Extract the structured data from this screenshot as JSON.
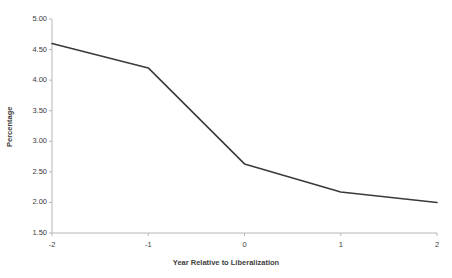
{
  "chart_data": {
    "type": "line",
    "title": "",
    "subtitle": "",
    "xlabel": "Year Relative to Liberalization",
    "ylabel": "Percentage",
    "x": [
      -2,
      -1,
      0,
      1,
      2
    ],
    "xtick_labels": [
      "-2",
      "-1",
      "0",
      "1",
      "2"
    ],
    "values": [
      4.6,
      4.2,
      2.63,
      2.17,
      2.0
    ],
    "ytick_labels": [
      "5.00",
      "4.50",
      "4.00",
      "3.50",
      "3.00",
      "2.50",
      "2.00",
      "1.50"
    ],
    "ytick_values": [
      5.0,
      4.5,
      4.0,
      3.5,
      3.0,
      2.5,
      2.0,
      1.5
    ],
    "xlim": [
      -2,
      2
    ],
    "ylim": [
      1.5,
      5.0
    ],
    "grid": false,
    "legend": null,
    "legend_position": "none",
    "series": [
      {
        "name": "Percentage",
        "values": [
          4.6,
          4.2,
          2.63,
          2.17,
          2.0
        ],
        "color": "#3a3a3a"
      }
    ],
    "annotations": []
  },
  "style": {
    "line_color": "#3a3a3a",
    "axis_color": "#b6b6b6",
    "text_color": "#3d3d3d",
    "background": "#ffffff"
  }
}
